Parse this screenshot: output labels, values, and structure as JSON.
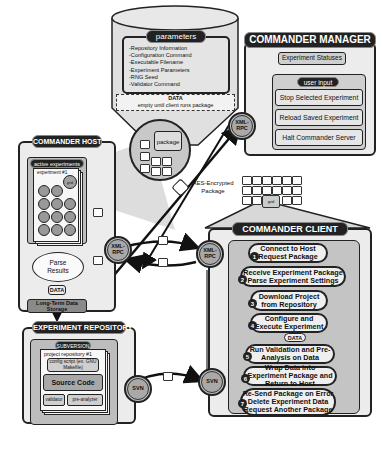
{
  "parameters_tank": {
    "title": "parameters",
    "items": [
      "-Repository Information",
      "-Configuration Command",
      "-Executable Filename",
      "-Experiment Parameters",
      "-RNG Seed",
      "-Validator Command"
    ],
    "data_label": "DATA",
    "data_note": "empty until client runs package",
    "package_label": "package"
  },
  "commander_manager": {
    "title": "COMMANDER MANAGER",
    "statuses_label": "Experiment Statuses",
    "user_input_label": "user input",
    "buttons": [
      "Stop Selected Experiment",
      "Reload Saved Experiment",
      "Halt Commander Server"
    ],
    "rpc_label": "XML-RPC"
  },
  "commander_host": {
    "title": "COMMANDER HOST",
    "active_label": "active experiments",
    "experiment_label": "experiment #1",
    "grid_node_label": "grid",
    "parse_label": "Parse Results",
    "data_label": "DATA",
    "storage_label": "Long-Term Data Storage",
    "rpc_label": "XML-RPC"
  },
  "transport": {
    "aes_label": "AES-Encrypted Package"
  },
  "grid": {
    "label": "grid"
  },
  "commander_client": {
    "title": "COMMANDER CLIENT",
    "rpc_label": "XML-RPC",
    "svn_label": "SVN",
    "data_label": "DATA",
    "steps": [
      {
        "num": "1",
        "text": "Connect to Host Request Package"
      },
      {
        "num": "2",
        "text": "Receive Experiment Package Parse Experiment Settings"
      },
      {
        "num": "3",
        "text": "Download Project from Repository"
      },
      {
        "num": "4",
        "text": "Configure and Execute Experiment"
      },
      {
        "num": "5",
        "text": "Run Validation and Pre-Analysis on Data"
      },
      {
        "num": "6",
        "text": "Wrap Data into Experiment Package and Return to Host"
      },
      {
        "num": "7",
        "text": "Re-Send Package on Error Delete Experiment Data Request Another Package"
      }
    ]
  },
  "experiment_repository": {
    "title": "EXPERIMENT REPOSITORY",
    "subversion_label": "SUBVERSION",
    "project_label": "project repository #1",
    "config_label": "config script (ex. GNU Makefile)",
    "source_label": "Source Code",
    "validator_label": "validator",
    "preanalyzer_label": "pre-analyzer",
    "svn_label": "SVN"
  }
}
